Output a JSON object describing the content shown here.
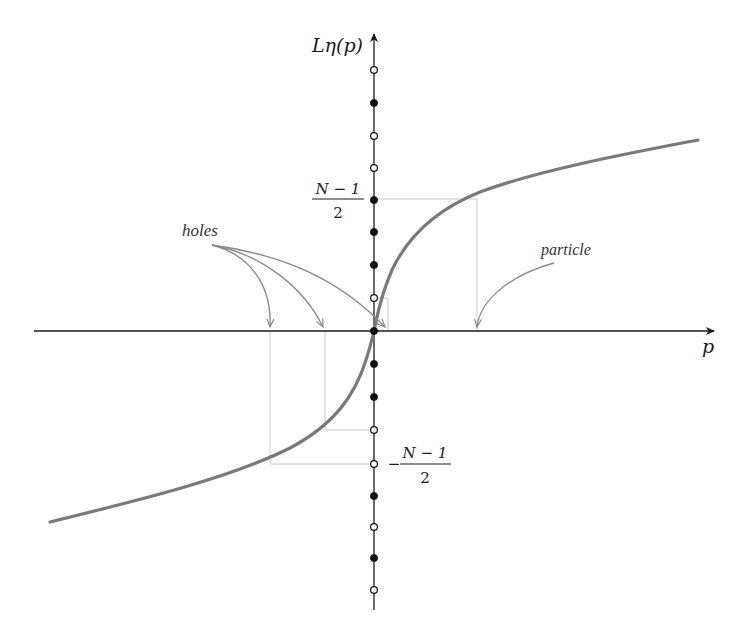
{
  "figure": {
    "y_axis_label": "Lη(p)",
    "x_axis_label": "p",
    "upper_level_label": {
      "numerator": "N − 1",
      "denominator": "2",
      "sign": ""
    },
    "lower_level_label": {
      "numerator": "N − 1",
      "denominator": "2",
      "sign": "−"
    },
    "annotation_holes": "holes",
    "annotation_particle": "particle",
    "colors": {
      "axis": "#1a1a1a",
      "curve": "#7a7a7a",
      "guide_lines": "#c8c8c8",
      "annotation_arrows": "#8a8a8a",
      "filled_dot": "#111111",
      "open_dot_fill": "#ffffff"
    },
    "lattice_sites": [
      {
        "y": 70,
        "state": "open"
      },
      {
        "y": 103,
        "state": "filled"
      },
      {
        "y": 136,
        "state": "open"
      },
      {
        "y": 168,
        "state": "open"
      },
      {
        "y": 200,
        "state": "filled"
      },
      {
        "y": 232,
        "state": "filled"
      },
      {
        "y": 265,
        "state": "filled"
      },
      {
        "y": 298,
        "state": "open"
      },
      {
        "y": 331,
        "state": "filled"
      },
      {
        "y": 364,
        "state": "filled"
      },
      {
        "y": 397,
        "state": "filled"
      },
      {
        "y": 430,
        "state": "open"
      },
      {
        "y": 464,
        "state": "open"
      },
      {
        "y": 496,
        "state": "filled"
      },
      {
        "y": 527,
        "state": "open"
      },
      {
        "y": 558,
        "state": "filled"
      },
      {
        "y": 590,
        "state": "open"
      }
    ]
  }
}
